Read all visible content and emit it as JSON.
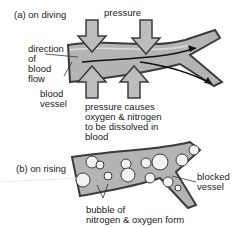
{
  "panel_a": {
    "title": "(a) on diving",
    "pressure_label": "pressure",
    "direction_label": "direction\nof\nblood\nflow",
    "vessel_label": "blood\nvessel",
    "caption": "pressure causes\noxygen & nitrogen\nto be dissolved in\nblood"
  },
  "panel_b": {
    "title": "(b) on rising",
    "blocked_label": "blocked\nvessel",
    "bubble_label": "bubble of\nnitrogen & oxygen form"
  },
  "colors": {
    "vessel_fill": "#b4b4b4",
    "vessel_edge": "#3c3c3c",
    "arrow_fill": "#bdbdbd",
    "bubble_fill": "#f2f2f2"
  }
}
